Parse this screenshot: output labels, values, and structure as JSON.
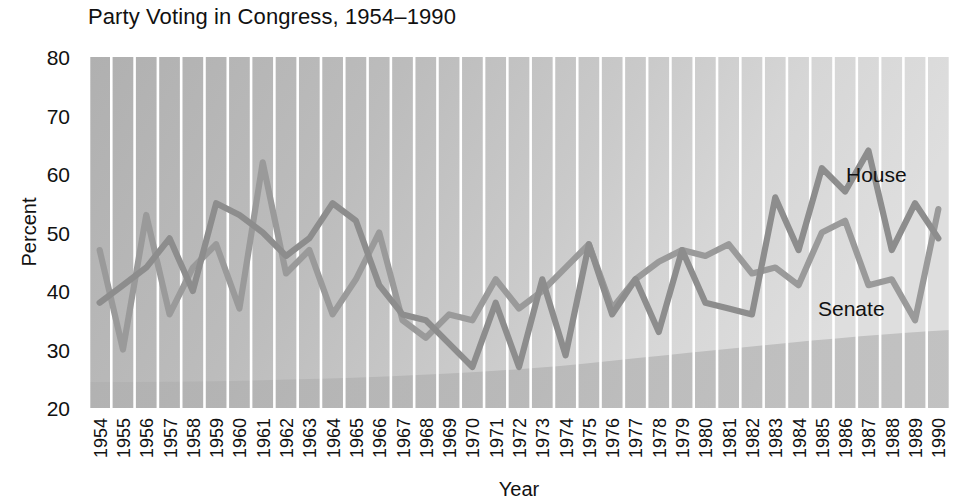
{
  "title": "Party Voting in Congress, 1954–1990",
  "axes": {
    "xlabel": "Year",
    "ylabel": "Percent",
    "ytick_labels": [
      "80",
      "70",
      "60",
      "50",
      "40",
      "30",
      "20"
    ],
    "xtick_labels": [
      "1954",
      "1955",
      "1956",
      "1957",
      "1958",
      "1959",
      "1960",
      "1961",
      "1962",
      "1963",
      "1964",
      "1965",
      "1966",
      "1967",
      "1968",
      "1969",
      "1970",
      "1971",
      "1972",
      "1973",
      "1974",
      "1975",
      "1976",
      "1977",
      "1978",
      "1979",
      "1980",
      "1981",
      "1982",
      "1983",
      "1984",
      "1985",
      "1986",
      "1987",
      "1988",
      "1989",
      "1990"
    ]
  },
  "series_labels": {
    "house": "House",
    "senate": "Senate"
  },
  "colors": {
    "house_line": "#8d8d8d",
    "senate_line": "#9a9a9a",
    "plot_background": "#b3b3b3",
    "gridline": "#ffffff",
    "text": "#111111"
  },
  "chart_data": {
    "type": "line",
    "title": "Party Voting in Congress, 1954–1990",
    "xlabel": "Year",
    "ylabel": "Percent",
    "ylim": [
      20,
      80
    ],
    "yticks": [
      20,
      30,
      40,
      50,
      60,
      70,
      80
    ],
    "grid": "vertical",
    "legend": "inline-annotation",
    "x": [
      1954,
      1955,
      1956,
      1957,
      1958,
      1959,
      1960,
      1961,
      1962,
      1963,
      1964,
      1965,
      1966,
      1967,
      1968,
      1969,
      1970,
      1971,
      1972,
      1973,
      1974,
      1975,
      1976,
      1977,
      1978,
      1979,
      1980,
      1981,
      1982,
      1983,
      1984,
      1985,
      1986,
      1987,
      1988,
      1989,
      1990
    ],
    "series": [
      {
        "name": "House",
        "values": [
          38,
          41,
          44,
          49,
          40,
          55,
          53,
          50,
          46,
          49,
          55,
          52,
          41,
          36,
          35,
          31,
          27,
          38,
          27,
          42,
          29,
          48,
          36,
          42,
          33,
          47,
          38,
          37,
          36,
          56,
          47,
          61,
          57,
          64,
          47,
          55,
          49
        ]
      },
      {
        "name": "Senate",
        "values": [
          47,
          30,
          53,
          36,
          44,
          48,
          37,
          62,
          43,
          47,
          36,
          42,
          50,
          35,
          32,
          36,
          35,
          42,
          37,
          40,
          44,
          48,
          37,
          42,
          45,
          47,
          46,
          48,
          43,
          44,
          41,
          50,
          52,
          41,
          42,
          35,
          54
        ]
      }
    ]
  }
}
